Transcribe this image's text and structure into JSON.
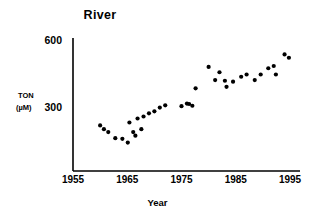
{
  "chart_data": {
    "type": "scatter",
    "title": "River",
    "xlabel": "Year",
    "ylabel": "TON (µM)",
    "ylabel_line1": "TON",
    "ylabel_line2": "(µM)",
    "xlim": [
      1955,
      1996
    ],
    "ylim": [
      100,
      620
    ],
    "xticks": [
      1955,
      1965,
      1975,
      1985,
      1995
    ],
    "xtick_labels": [
      "1955",
      "1965",
      "1975",
      "1985",
      "1995"
    ],
    "yticks": [
      300,
      600
    ],
    "ytick_labels": [
      "300",
      "600"
    ],
    "grid": false,
    "legend": null,
    "marker": {
      "shape": "circle",
      "color": "#000000",
      "size_px": 4.2
    },
    "axis_color": "#000000",
    "background": "#ffffff",
    "series": [
      {
        "name": "TON",
        "points": [
          [
            1960.0,
            222
          ],
          [
            1960.7,
            205
          ],
          [
            1961.5,
            192
          ],
          [
            1962.8,
            165
          ],
          [
            1964.1,
            162
          ],
          [
            1965.1,
            145
          ],
          [
            1965.4,
            235
          ],
          [
            1966.1,
            192
          ],
          [
            1966.5,
            176
          ],
          [
            1966.9,
            253
          ],
          [
            1967.6,
            205
          ],
          [
            1968.0,
            262
          ],
          [
            1969.0,
            276
          ],
          [
            1970.0,
            285
          ],
          [
            1971.0,
            302
          ],
          [
            1972.0,
            312
          ],
          [
            1975.0,
            308
          ],
          [
            1976.0,
            320
          ],
          [
            1976.4,
            318
          ],
          [
            1977.0,
            310
          ],
          [
            1977.6,
            388
          ],
          [
            1980.0,
            484
          ],
          [
            1981.2,
            425
          ],
          [
            1982.0,
            460
          ],
          [
            1983.0,
            422
          ],
          [
            1983.3,
            395
          ],
          [
            1984.5,
            418
          ],
          [
            1986.0,
            440
          ],
          [
            1987.0,
            450
          ],
          [
            1988.5,
            425
          ],
          [
            1989.6,
            450
          ],
          [
            1991.0,
            478
          ],
          [
            1992.0,
            488
          ],
          [
            1992.4,
            450
          ],
          [
            1994.0,
            540
          ],
          [
            1994.8,
            525
          ]
        ]
      }
    ]
  },
  "axes_geometry": {
    "x_px_1955": 73,
    "x_px_1995": 290,
    "y_px_600": 41,
    "y_px_300": 108,
    "axis_left_px": 73,
    "axis_bottom_px": 171,
    "axis_top_px": 38,
    "axis_right_px": 300
  }
}
